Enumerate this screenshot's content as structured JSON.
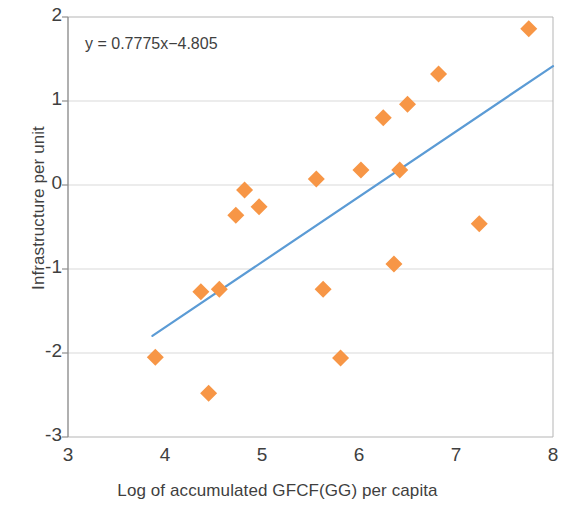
{
  "chart_data": {
    "type": "scatter",
    "title": "",
    "xlabel": "Log of accumulated GFCF(GG) per capita",
    "ylabel": "Infrastructure per unit",
    "xlim": [
      3,
      8
    ],
    "ylim": [
      -3,
      2
    ],
    "xticks": [
      3,
      4,
      5,
      6,
      7,
      8
    ],
    "yticks": [
      2,
      1,
      0,
      -1,
      -2,
      -3
    ],
    "xtick_labels": [
      "3",
      "4",
      "5",
      "6",
      "7",
      "8"
    ],
    "ytick_labels": [
      "2",
      "1",
      "0",
      "-1",
      "-2",
      "-3"
    ],
    "grid": "horizontal",
    "legend": null,
    "annotations": [
      {
        "name": "regression-equation",
        "text": "y = 0.7775x−4.805"
      }
    ],
    "series": [
      {
        "name": "observations",
        "type": "scatter",
        "marker": "diamond",
        "color": "#F79646",
        "points": [
          {
            "x": 3.9,
            "y": -2.05
          },
          {
            "x": 4.37,
            "y": -1.27
          },
          {
            "x": 4.45,
            "y": -2.48
          },
          {
            "x": 4.56,
            "y": -1.24
          },
          {
            "x": 4.73,
            "y": -0.36
          },
          {
            "x": 4.82,
            "y": -0.06
          },
          {
            "x": 4.97,
            "y": -0.26
          },
          {
            "x": 5.56,
            "y": 0.07
          },
          {
            "x": 5.63,
            "y": -1.24
          },
          {
            "x": 5.81,
            "y": -2.06
          },
          {
            "x": 6.02,
            "y": 0.18
          },
          {
            "x": 6.25,
            "y": 0.8
          },
          {
            "x": 6.36,
            "y": -0.94
          },
          {
            "x": 6.42,
            "y": 0.18
          },
          {
            "x": 6.5,
            "y": 0.96
          },
          {
            "x": 6.82,
            "y": 1.32
          },
          {
            "x": 7.24,
            "y": -0.46
          },
          {
            "x": 7.75,
            "y": 1.86
          }
        ]
      },
      {
        "name": "trendline",
        "type": "line",
        "color": "#4BACC6",
        "slope": 0.7775,
        "intercept": -4.805,
        "x_start": 3.87,
        "x_end": 8.0
      }
    ]
  },
  "colors": {
    "marker": "#F79646",
    "trendline": "#5B9BD5",
    "axis": "#9a9a9a",
    "gridline": "#d9d9d9",
    "text": "#3f3f3f"
  }
}
